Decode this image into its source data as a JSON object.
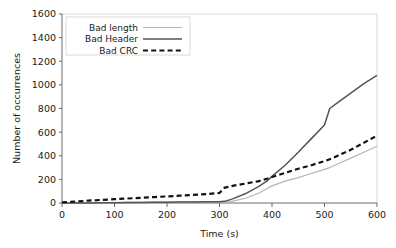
{
  "chart_data": {
    "type": "line",
    "title": "",
    "xlabel": "Time (s)",
    "ylabel": "Number of occurrences",
    "xlim": [
      0,
      600
    ],
    "ylim": [
      0,
      1600
    ],
    "xticks": [
      0,
      100,
      200,
      300,
      400,
      500,
      600
    ],
    "yticks": [
      0,
      200,
      400,
      600,
      800,
      1000,
      1200,
      1400,
      1600
    ],
    "grid": false,
    "legend_position": "top-left",
    "x": [
      0,
      25,
      50,
      75,
      100,
      125,
      150,
      175,
      200,
      225,
      250,
      275,
      300,
      310,
      325,
      350,
      375,
      390,
      400,
      425,
      450,
      475,
      500,
      510,
      525,
      550,
      575,
      600
    ],
    "series": [
      {
        "name": "Bad length",
        "color": "#b5b5b5",
        "style": "solid",
        "width": 1.2,
        "values": [
          0,
          0,
          2,
          3,
          4,
          5,
          6,
          7,
          8,
          9,
          10,
          11,
          12,
          13,
          16,
          40,
          85,
          120,
          145,
          185,
          215,
          250,
          285,
          300,
          330,
          380,
          430,
          480
        ]
      },
      {
        "name": "Bad Header",
        "color": "#555555",
        "style": "solid",
        "width": 1.5,
        "values": [
          0,
          0,
          1,
          2,
          3,
          4,
          5,
          6,
          7,
          8,
          9,
          10,
          11,
          14,
          35,
          80,
          140,
          185,
          225,
          320,
          430,
          545,
          660,
          800,
          850,
          930,
          1010,
          1080
        ]
      },
      {
        "name": "Bad CRC",
        "color": "#111111",
        "style": "dashed",
        "width": 2.2,
        "values": [
          5,
          12,
          20,
          26,
          32,
          38,
          44,
          50,
          56,
          62,
          68,
          76,
          85,
          130,
          145,
          165,
          185,
          205,
          220,
          255,
          290,
          320,
          355,
          370,
          400,
          450,
          510,
          570
        ]
      }
    ],
    "legend": [
      {
        "label": "Bad length",
        "color": "#b5b5b5",
        "style": "solid",
        "width": 1.2
      },
      {
        "label": "Bad Header",
        "color": "#555555",
        "style": "solid",
        "width": 1.5
      },
      {
        "label": "Bad CRC",
        "color": "#111111",
        "style": "dashed",
        "width": 2.2
      }
    ]
  },
  "layout": {
    "plot_left": 62,
    "plot_right": 377,
    "plot_top": 14,
    "plot_bottom": 203
  }
}
